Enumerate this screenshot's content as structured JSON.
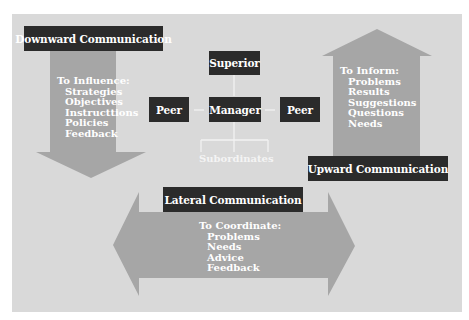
{
  "colors": {
    "background": "#ffffff",
    "panel": "#d9d9d9",
    "arrow": "#a6a6a6",
    "box": "#2b2b2b",
    "text": "#ffffff"
  },
  "downward": {
    "title": "Downward Communication",
    "heading": "To Influence:",
    "items": [
      "Strategies",
      "Objectives",
      "Instructtions",
      "Policies",
      "Feedback"
    ]
  },
  "upward": {
    "title": "Upward Communication",
    "heading": "To Inform:",
    "items": [
      "Problems",
      "Results",
      "Suggestions",
      "Questions",
      "Needs"
    ]
  },
  "lateral": {
    "title": "Lateral Communication",
    "heading": "To Coordinate:",
    "items": [
      "Problems",
      "Needs",
      "Advice",
      "Feedback"
    ]
  },
  "org": {
    "superior": "Superior",
    "manager": "Manager",
    "peer_left": "Peer",
    "peer_right": "Peer",
    "subordinates": "Subordinates"
  }
}
